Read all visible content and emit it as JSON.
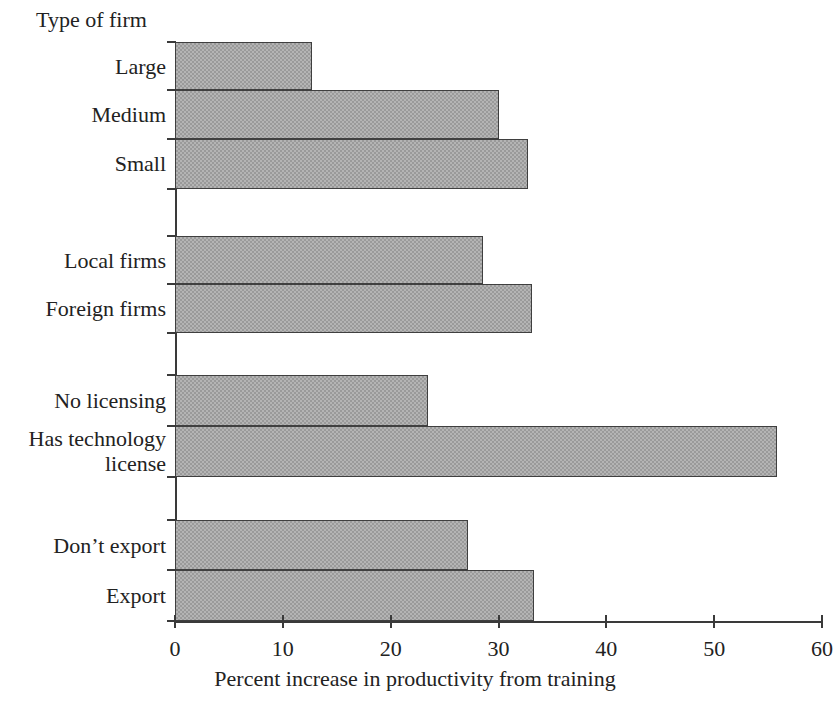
{
  "chart_data": {
    "type": "bar",
    "orientation": "horizontal",
    "title": "",
    "xlabel": "Percent increase in productivity from training",
    "ylabel": "Type of firm",
    "xlim": [
      0,
      60
    ],
    "xticks": [
      0,
      10,
      20,
      30,
      40,
      50,
      60
    ],
    "xtick_labels": [
      "0",
      "10",
      "20",
      "30",
      "40",
      "50",
      "60"
    ],
    "grid": false,
    "legend": null,
    "bar_fill_color": "#b4b4b4",
    "bar_edge_color": "#3f3f3f",
    "axis_color": "#3a3a3a",
    "background_color": "#ffffff",
    "groups": [
      {
        "name": "firm-size",
        "categories": [
          "Large",
          "Medium",
          "Small"
        ],
        "values": [
          12.7,
          30.0,
          32.7
        ]
      },
      {
        "name": "ownership",
        "categories": [
          "Local firms",
          "Foreign firms"
        ],
        "values": [
          28.6,
          33.1
        ]
      },
      {
        "name": "licensing",
        "categories": [
          "No licensing",
          "Has technology\nlicense"
        ],
        "values": [
          23.5,
          55.8
        ]
      },
      {
        "name": "exporting",
        "categories": [
          "Don’t export",
          "Export"
        ],
        "values": [
          27.2,
          33.3
        ]
      }
    ],
    "categories": [
      "Large",
      "Medium",
      "Small",
      "Local firms",
      "Foreign firms",
      "No licensing",
      "Has technology\nlicense",
      "Don’t export",
      "Export"
    ],
    "values": [
      12.7,
      30.0,
      32.7,
      28.6,
      33.1,
      23.5,
      55.8,
      27.2,
      33.3
    ]
  },
  "bars": [
    {
      "label": "Large",
      "value": 12.7,
      "top": 42,
      "height": 48
    },
    {
      "label": "Medium",
      "value": 30.0,
      "top": 90,
      "height": 49
    },
    {
      "label": "Small",
      "value": 32.7,
      "top": 139,
      "height": 50
    },
    {
      "label": "Local firms",
      "value": 28.6,
      "top": 236,
      "height": 48
    },
    {
      "label": "Foreign firms",
      "value": 33.1,
      "top": 284,
      "height": 49
    },
    {
      "label": "No licensing",
      "value": 23.5,
      "top": 375,
      "height": 51
    },
    {
      "label": "Has technology\nlicense",
      "value": 55.8,
      "top": 426,
      "height": 51
    },
    {
      "label": "Don’t export",
      "value": 27.2,
      "top": 520,
      "height": 50
    },
    {
      "label": "Export",
      "value": 33.3,
      "top": 570,
      "height": 51
    }
  ],
  "labels": [
    {
      "text": "Large",
      "top": 54
    },
    {
      "text": "Medium",
      "top": 102
    },
    {
      "text": "Small",
      "top": 151
    },
    {
      "text": "Local firms",
      "top": 248
    },
    {
      "text": "Foreign firms",
      "top": 296
    },
    {
      "text": "No licensing",
      "top": 388
    },
    {
      "text": "Has technology\nlicense",
      "top": 426
    },
    {
      "text": "Don’t export",
      "top": 533
    },
    {
      "text": "Export",
      "top": 583
    }
  ]
}
